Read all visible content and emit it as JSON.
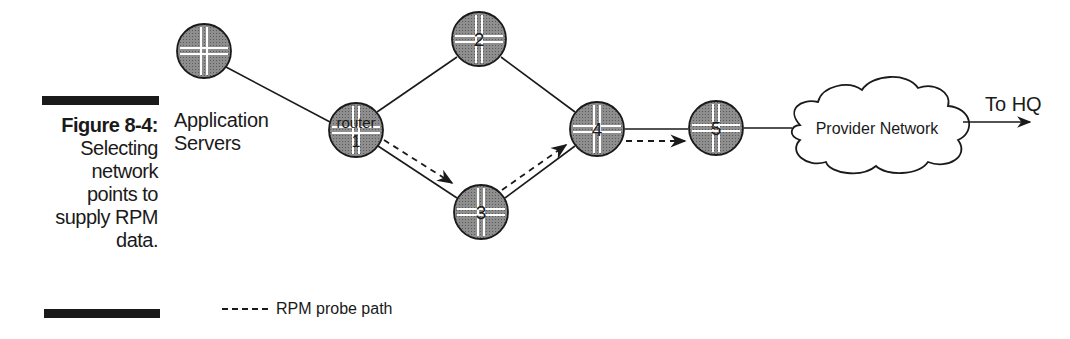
{
  "caption": {
    "figure_label": "Figure 8-4:",
    "description": "Selecting\nnetwork\npoints to\nsupply RPM\ndata."
  },
  "app_servers": {
    "line1": "Application",
    "line2": "Servers"
  },
  "nodes": [
    {
      "id": "app",
      "label": "",
      "sublabel": ""
    },
    {
      "id": "r1",
      "label": "router",
      "sublabel": "1"
    },
    {
      "id": "r2",
      "label": "2",
      "sublabel": ""
    },
    {
      "id": "r3",
      "label": "3",
      "sublabel": ""
    },
    {
      "id": "r4",
      "label": "4",
      "sublabel": ""
    },
    {
      "id": "r5",
      "label": "5",
      "sublabel": ""
    }
  ],
  "links": [
    [
      "app",
      "r1"
    ],
    [
      "r1",
      "r2"
    ],
    [
      "r2",
      "r4"
    ],
    [
      "r1",
      "r3"
    ],
    [
      "r3",
      "r4"
    ],
    [
      "r4",
      "r5"
    ],
    [
      "r5",
      "cloud"
    ]
  ],
  "probe_path": [
    [
      "r1",
      "r3"
    ],
    [
      "r3",
      "r4"
    ],
    [
      "r4",
      "r5"
    ]
  ],
  "cloud": {
    "label": "Provider Network"
  },
  "exit": {
    "label": "To HQ"
  },
  "legend": {
    "label": "RPM probe path",
    "icon": "dashed-line"
  },
  "colors": {
    "router_fill": "#8c8c8c",
    "stroke": "#1a1a1a",
    "cross": "#ffffff"
  }
}
